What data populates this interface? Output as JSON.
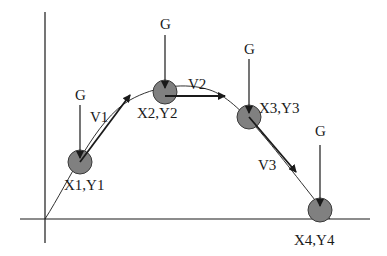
{
  "diagram": {
    "title": "",
    "colors": {
      "line": "#1a1a1a",
      "ball_fill": "#808080",
      "ball_stroke": "#3a3a3a",
      "background": "#ffffff"
    },
    "axes": {
      "y_axis": {
        "x": 45,
        "y1": 12,
        "y2": 243
      },
      "x_axis": {
        "y": 219,
        "x1": 20,
        "x2": 370
      }
    },
    "trajectory_path": "M45,219 C70,180 95,120 130,100 C155,86 185,82 210,90 C240,100 275,150 330,219",
    "balls": [
      {
        "id": "ball-1",
        "cx": 80,
        "cy": 162,
        "r": 12,
        "label": "X1,Y1",
        "lx": 64,
        "ly": 190
      },
      {
        "id": "ball-2",
        "cx": 165,
        "cy": 92,
        "r": 12,
        "label": "X2,Y2",
        "lx": 137,
        "ly": 118
      },
      {
        "id": "ball-3",
        "cx": 249,
        "cy": 117,
        "r": 12,
        "label": "X3,Y3",
        "lx": 259,
        "ly": 113
      },
      {
        "id": "ball-4",
        "cx": 320,
        "cy": 210,
        "r": 12,
        "label": "X4,Y4",
        "lx": 294,
        "ly": 245
      }
    ],
    "gravity_arrows": [
      {
        "label": "G",
        "x": 80,
        "y1": 105,
        "y2": 158,
        "lx": 75,
        "ly": 100
      },
      {
        "label": "G",
        "x": 165,
        "y1": 35,
        "y2": 88,
        "lx": 160,
        "ly": 29
      },
      {
        "label": "G",
        "x": 249,
        "y1": 59,
        "y2": 113,
        "lx": 244,
        "ly": 54
      },
      {
        "label": "G",
        "x": 320,
        "y1": 145,
        "y2": 206,
        "lx": 315,
        "ly": 136
      }
    ],
    "velocity_arrows": [
      {
        "label": "V1",
        "x1": 80,
        "y1": 162,
        "x2": 130,
        "y2": 95,
        "lx": 90,
        "ly": 122
      },
      {
        "label": "V2",
        "x1": 165,
        "y1": 96,
        "x2": 225,
        "y2": 96,
        "lx": 188,
        "ly": 89
      },
      {
        "label": "V3",
        "x1": 249,
        "y1": 117,
        "x2": 296,
        "y2": 172,
        "lx": 258,
        "ly": 170
      }
    ]
  }
}
